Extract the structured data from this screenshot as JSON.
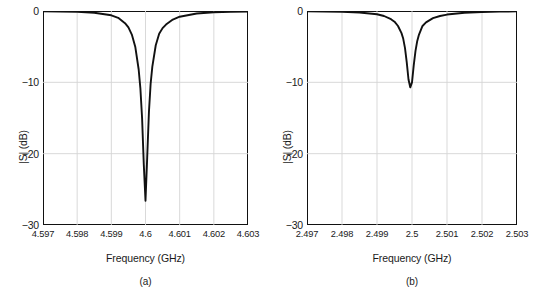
{
  "figure": {
    "panels": [
      {
        "caption": "(a)",
        "xlabel": "Frequency (GHz)",
        "ylabel": "|S| (dB)",
        "xticks": [
          "4.597",
          "4.598",
          "4.599",
          "4.6",
          "4.601",
          "4.602",
          "4.603"
        ],
        "yticks": [
          "0",
          "−10",
          "−20",
          "−30"
        ]
      },
      {
        "caption": "(b)",
        "xlabel": "Frequency (GHz)",
        "ylabel": "|S| (dB)",
        "xticks": [
          "2.497",
          "2.498",
          "2.499",
          "2.5",
          "2.501",
          "2.502",
          "2.503"
        ],
        "yticks": [
          "0",
          "−10",
          "−20",
          "−30"
        ]
      }
    ]
  },
  "style": {
    "curve_color": "#111111",
    "frame_color": "#111111",
    "grid_color": "#d5d5d5",
    "background": "#ffffff"
  },
  "chart_data": [
    {
      "type": "line",
      "title": "(a)",
      "xlabel": "Frequency (GHz)",
      "ylabel": "|S| (dB)",
      "xlim": [
        4.597,
        4.603
      ],
      "ylim": [
        -30,
        0
      ],
      "xticks": [
        4.597,
        4.598,
        4.599,
        4.6,
        4.601,
        4.602,
        4.603
      ],
      "yticks": [
        0,
        -10,
        -20,
        -30
      ],
      "grid": true,
      "legend": "none",
      "resonance": {
        "center_ghz": 4.5999,
        "depth_db": -26.6,
        "shape": "notch"
      },
      "x": [
        4.597,
        4.5975,
        4.598,
        4.5985,
        4.599,
        4.5992,
        4.5994,
        4.5995,
        4.5996,
        4.5997,
        4.5998,
        4.59985,
        4.5999,
        4.59995,
        4.6,
        4.60005,
        4.6001,
        4.60015,
        4.6002,
        4.6003,
        4.6004,
        4.6005,
        4.6006,
        4.6008,
        4.601,
        4.6015,
        4.602,
        4.6025,
        4.603
      ],
      "y": [
        -0.05,
        -0.07,
        -0.12,
        -0.25,
        -0.6,
        -0.95,
        -1.7,
        -2.3,
        -3.3,
        -5.0,
        -8.2,
        -10.8,
        -15.0,
        -21.5,
        -26.6,
        -20.5,
        -14.2,
        -10.2,
        -7.8,
        -4.8,
        -3.2,
        -2.4,
        -1.9,
        -1.2,
        -0.8,
        -0.35,
        -0.18,
        -0.1,
        -0.06
      ]
    },
    {
      "type": "line",
      "title": "(b)",
      "xlabel": "Frequency (GHz)",
      "ylabel": "|S| (dB)",
      "xlim": [
        2.497,
        2.503
      ],
      "ylim": [
        -30,
        0
      ],
      "xticks": [
        2.497,
        2.498,
        2.499,
        2.5,
        2.501,
        2.502,
        2.503
      ],
      "yticks": [
        0,
        -10,
        -20,
        -30
      ],
      "grid": true,
      "legend": "none",
      "resonance": {
        "center_ghz": 2.49985,
        "depth_db": -10.7,
        "shape": "notch"
      },
      "x": [
        2.497,
        2.4975,
        2.498,
        2.4985,
        2.499,
        2.4992,
        2.4994,
        2.4995,
        2.4996,
        2.4997,
        2.49975,
        2.4998,
        2.49985,
        2.4999,
        2.49995,
        2.5,
        2.50005,
        2.5001,
        2.50015,
        2.5002,
        2.5003,
        2.5004,
        2.5006,
        2.5008,
        2.501,
        2.5015,
        2.502,
        2.5025,
        2.503
      ],
      "y": [
        -0.04,
        -0.06,
        -0.1,
        -0.2,
        -0.45,
        -0.7,
        -1.15,
        -1.5,
        -2.1,
        -3.1,
        -3.9,
        -5.2,
        -7.2,
        -9.6,
        -10.7,
        -10.0,
        -7.6,
        -5.6,
        -4.2,
        -3.3,
        -2.1,
        -1.6,
        -1.0,
        -0.7,
        -0.5,
        -0.25,
        -0.14,
        -0.09,
        -0.05
      ]
    }
  ]
}
